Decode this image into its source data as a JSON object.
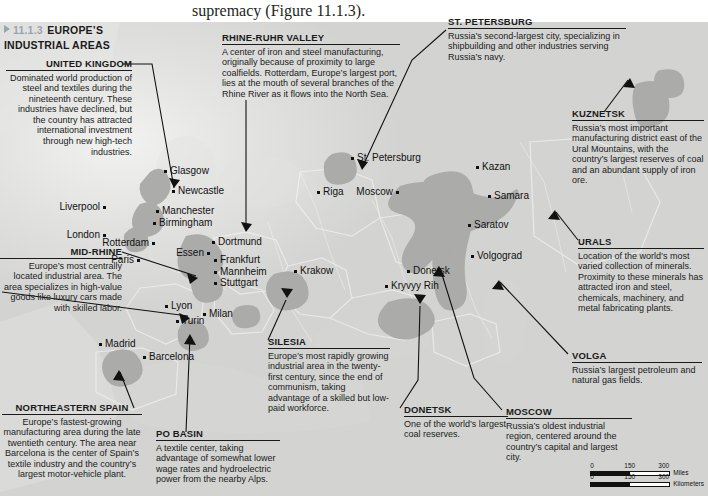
{
  "book_text": {
    "line1": "supremacy (Figure 11.1.3).",
    "line1_above": ""
  },
  "section": {
    "number": "11.1.3",
    "title_line1": "EUROPE’S",
    "title_line2": "INDUSTRIAL AREAS",
    "triangle_icon": "triangle-right-icon",
    "number_color": "#9aa4ab"
  },
  "callouts": [
    {
      "id": "united-kingdom",
      "heading": "UNITED KINGDOM",
      "body": "Dominated world production of steel and textiles during the nineteenth century. These industries have declined, but the country has attracted international investment through new high-tech industries."
    },
    {
      "id": "rhine-ruhr-valley",
      "heading": "RHINE-RUHR VALLEY",
      "body": "A center of iron and steel manufacturing, originally because of proximity to large coalfields. Rotterdam, Europe’s largest port, lies at the mouth of several branches of the Rhine River as it flows into the North Sea."
    },
    {
      "id": "st-petersburg",
      "heading": "ST. PETERSBURG",
      "body": "Russia’s second-largest city, specializing in shipbuilding and other industries serving Russia’s navy."
    },
    {
      "id": "kuznetsk",
      "heading": "KUZNETSK",
      "body": "Russia’s most important manufacturing district east of the Ural Mountains, with the country’s largest reserves of coal and an abundant supply of iron ore."
    },
    {
      "id": "urals",
      "heading": "URALS",
      "body": "Location of the world’s most varied collection of minerals. Proximity to these minerals has attracted iron and steel, chemicals, machinery, and metal fabricating plants."
    },
    {
      "id": "volga",
      "heading": "VOLGA",
      "body": "Russia’s largest petroleum and natural gas fields."
    },
    {
      "id": "moscow",
      "heading": "MOSCOW",
      "body": "Russia’s oldest industrial region, centered around the country’s capital and largest city."
    },
    {
      "id": "donetsk",
      "heading": "DONETSK",
      "body": "One of the world’s largest coal reserves."
    },
    {
      "id": "silesia",
      "heading": "SILESIA",
      "body": "Europe’s most rapidly growing industrial area in the twenty-first century, since the end of communism, taking advantage of a skilled but low-paid workforce."
    },
    {
      "id": "po-basin",
      "heading": "PO BASIN",
      "body": "A textile center, taking advantage of somewhat lower wage rates and hydroelectric power from the nearby Alps."
    },
    {
      "id": "northeastern-spain",
      "heading": "NORTHEASTERN SPAIN",
      "body": "Europe’s fastest-growing manufacturing area during the late twentieth century. The area near Barcelona is the center of Spain’s textile industry and the country’s largest motor-vehicle plant."
    },
    {
      "id": "mid-rhine",
      "heading": "MID-RHINE",
      "body": "Europe’s most centrally located industrial area. The area specializes in high-value goods like luxury cars made with skilled labor."
    }
  ],
  "cities": [
    {
      "name": "Glasgow",
      "x": 166,
      "y": 170,
      "side": "left"
    },
    {
      "name": "Newcastle",
      "x": 174,
      "y": 190,
      "side": "left"
    },
    {
      "name": "Liverpool",
      "x": 104,
      "y": 206,
      "side": "right"
    },
    {
      "name": "Manchester",
      "x": 158,
      "y": 210,
      "side": "left"
    },
    {
      "name": "Birmingham",
      "x": 155,
      "y": 222,
      "side": "left"
    },
    {
      "name": "London",
      "x": 104,
      "y": 234,
      "side": "right"
    },
    {
      "name": "Rotterdam",
      "x": 153,
      "y": 242,
      "side": "right"
    },
    {
      "name": "Dortmund",
      "x": 214,
      "y": 241,
      "side": "left"
    },
    {
      "name": "Essen",
      "x": 208,
      "y": 252,
      "side": "right"
    },
    {
      "name": "Paris",
      "x": 138,
      "y": 259,
      "side": "right"
    },
    {
      "name": "Frankfurt",
      "x": 216,
      "y": 259,
      "side": "left"
    },
    {
      "name": "Mannheim",
      "x": 216,
      "y": 271,
      "side": "left"
    },
    {
      "name": "Stuttgart",
      "x": 216,
      "y": 282,
      "side": "left"
    },
    {
      "name": "Krakow",
      "x": 296,
      "y": 270,
      "side": "left"
    },
    {
      "name": "Riga",
      "x": 319,
      "y": 191,
      "side": "left"
    },
    {
      "name": "St. Petersburg",
      "x": 353,
      "y": 157,
      "side": "left"
    },
    {
      "name": "Moscow",
      "x": 397,
      "y": 191,
      "side": "right"
    },
    {
      "name": "Kazan",
      "x": 478,
      "y": 166,
      "side": "left"
    },
    {
      "name": "Samara",
      "x": 490,
      "y": 195,
      "side": "left"
    },
    {
      "name": "Saratov",
      "x": 470,
      "y": 224,
      "side": "left"
    },
    {
      "name": "Volgograd",
      "x": 473,
      "y": 255,
      "side": "left"
    },
    {
      "name": "Donetsk",
      "x": 409,
      "y": 270,
      "side": "left"
    },
    {
      "name": "Kryvyy Rih",
      "x": 387,
      "y": 285,
      "side": "left"
    },
    {
      "name": "Lyon",
      "x": 167,
      "y": 305,
      "side": "left"
    },
    {
      "name": "Turin",
      "x": 178,
      "y": 320,
      "side": "left"
    },
    {
      "name": "Milan",
      "x": 205,
      "y": 313,
      "side": "left"
    },
    {
      "name": "Madrid",
      "x": 101,
      "y": 343,
      "side": "left"
    },
    {
      "name": "Barcelona",
      "x": 145,
      "y": 356,
      "side": "left"
    }
  ],
  "scale": {
    "miles_ticks": [
      "0",
      "150",
      "300"
    ],
    "miles_label": "Miles",
    "km_ticks": [
      "0",
      "150",
      "300"
    ],
    "km_label": "Kilometers"
  },
  "colors": {
    "industrial_region": "#a8a9a7",
    "land": "#dcdcda",
    "water": "#dfe0de",
    "text": "#1a1a1a",
    "section_number": "#9aa4ab"
  }
}
